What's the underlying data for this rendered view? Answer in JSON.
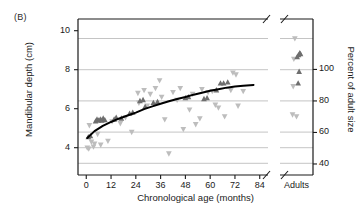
{
  "figure": {
    "panel_label": "(B)",
    "background": "#ffffff",
    "frame_color": "#1a1a1a",
    "gridline_color": "#b5b5b5",
    "curve_color": "#000000",
    "marker_dark_color": "#6e6e6e",
    "marker_light_color": "#bdbdbd"
  },
  "chart_data": {
    "type": "scatter",
    "title": "",
    "subtitle": "",
    "panel": "(B)",
    "xlabel": "Chronological age (months)",
    "ylabel": "Mandibular depth (cm)",
    "y2label": "Percent of adult size",
    "xlim": [
      -4,
      88
    ],
    "ylim": [
      2.6,
      10.6
    ],
    "y2lim": [
      33,
      132
    ],
    "grid": true,
    "grid_axis": "y",
    "legend": "none",
    "axis_break_x": true,
    "axis_break_note": "x-axis broken after 84 months; separate 'Adults' category panel at right",
    "xticks": [
      0,
      12,
      24,
      36,
      48,
      60,
      72,
      84
    ],
    "xticklabels": [
      "0",
      "12",
      "24",
      "36",
      "48",
      "60",
      "72",
      "84"
    ],
    "extra_xtick_label": "Adults",
    "yticks": [
      4,
      6,
      8,
      10
    ],
    "yticklabels": [
      "4",
      "6",
      "8",
      "10"
    ],
    "y2ticks": [
      40,
      60,
      80,
      100
    ],
    "y2ticklabels": [
      "40",
      "60",
      "80",
      "100"
    ],
    "gridline_values": [
      3.2,
      4.0,
      4.8,
      6.4,
      8.0,
      9.6
    ],
    "series": [
      {
        "name": "dark-up-triangles",
        "marker": "triangle-up",
        "color": "#6e6e6e",
        "points": [
          [
            1.0,
            4.55
          ],
          [
            2.0,
            4.6
          ],
          [
            4.5,
            5.35
          ],
          [
            5.2,
            5.45
          ],
          [
            6.0,
            5.4
          ],
          [
            6.8,
            5.45
          ],
          [
            7.5,
            5.4
          ],
          [
            8.2,
            5.5
          ],
          [
            9.0,
            5.42
          ],
          [
            13.5,
            5.45
          ],
          [
            14.5,
            5.55
          ],
          [
            17.0,
            5.5
          ],
          [
            21.0,
            5.75
          ],
          [
            22.5,
            5.8
          ],
          [
            26.0,
            6.4
          ],
          [
            27.5,
            6.45
          ],
          [
            28.5,
            6.1
          ],
          [
            32.5,
            6.3
          ],
          [
            34.5,
            6.35
          ],
          [
            48.0,
            6.55
          ],
          [
            49.5,
            6.6
          ],
          [
            57.0,
            6.5
          ],
          [
            58.5,
            6.55
          ],
          [
            63.0,
            6.95
          ],
          [
            65.0,
            7.3
          ],
          [
            66.5,
            7.3
          ],
          [
            68.5,
            7.35
          ]
        ]
      },
      {
        "name": "light-down-triangles",
        "marker": "triangle-down",
        "color": "#bdbdbd",
        "points": [
          [
            0.5,
            4.0
          ],
          [
            1.2,
            3.95
          ],
          [
            1.5,
            5.15
          ],
          [
            2.5,
            4.3
          ],
          [
            3.5,
            4.05
          ],
          [
            4.0,
            4.2
          ],
          [
            5.5,
            4.7
          ],
          [
            7.0,
            4.15
          ],
          [
            10.5,
            4.35
          ],
          [
            12.5,
            5.35
          ],
          [
            16.5,
            5.25
          ],
          [
            19.0,
            5.55
          ],
          [
            22.0,
            4.8
          ],
          [
            25.0,
            6.8
          ],
          [
            25.5,
            6.3
          ],
          [
            28.0,
            6.95
          ],
          [
            29.5,
            6.15
          ],
          [
            31.0,
            6.75
          ],
          [
            33.5,
            7.05
          ],
          [
            35.5,
            7.45
          ],
          [
            36.5,
            6.6
          ],
          [
            38.0,
            5.45
          ],
          [
            40.0,
            3.7
          ],
          [
            42.0,
            6.85
          ],
          [
            44.0,
            6.45
          ],
          [
            45.5,
            7.05
          ],
          [
            47.0,
            4.95
          ],
          [
            50.0,
            5.95
          ],
          [
            51.5,
            6.75
          ],
          [
            53.0,
            5.2
          ],
          [
            55.0,
            5.5
          ],
          [
            56.0,
            7.0
          ],
          [
            59.0,
            6.85
          ],
          [
            61.0,
            6.9
          ],
          [
            62.5,
            6.2
          ],
          [
            64.0,
            6.05
          ],
          [
            67.0,
            5.6
          ],
          [
            70.0,
            6.95
          ],
          [
            71.0,
            7.85
          ],
          [
            72.5,
            7.75
          ],
          [
            73.5,
            6.15
          ],
          [
            76.0,
            6.9
          ]
        ]
      },
      {
        "name": "adults-dark-up-triangles",
        "marker": "triangle-up",
        "color": "#6e6e6e",
        "category": "Adults",
        "points": [
          [
            0.52,
            8.65
          ],
          [
            0.56,
            8.75
          ],
          [
            0.6,
            8.85
          ],
          [
            0.62,
            8.8
          ],
          [
            0.58,
            7.9
          ],
          [
            0.55,
            7.3
          ]
        ]
      },
      {
        "name": "adults-light-down-triangles",
        "marker": "triangle-down",
        "color": "#bdbdbd",
        "category": "Adults",
        "points": [
          [
            0.45,
            9.6
          ],
          [
            0.42,
            8.55
          ],
          [
            0.4,
            7.15
          ],
          [
            0.38,
            5.7
          ],
          [
            0.5,
            5.6
          ]
        ]
      }
    ],
    "fit_curve": {
      "name": "fitted-growth-curve",
      "color": "#000000",
      "width": 2,
      "description": "logarithmic growth fit",
      "points": [
        [
          0.5,
          4.5
        ],
        [
          4,
          4.85
        ],
        [
          8,
          5.12
        ],
        [
          12,
          5.32
        ],
        [
          16,
          5.5
        ],
        [
          20,
          5.65
        ],
        [
          24,
          5.8
        ],
        [
          28,
          5.98
        ],
        [
          32,
          6.12
        ],
        [
          36,
          6.25
        ],
        [
          40,
          6.38
        ],
        [
          44,
          6.5
        ],
        [
          48,
          6.6
        ],
        [
          52,
          6.72
        ],
        [
          56,
          6.82
        ],
        [
          60,
          6.92
        ],
        [
          64,
          7.0
        ],
        [
          68,
          7.08
        ],
        [
          72,
          7.14
        ],
        [
          76,
          7.18
        ],
        [
          81,
          7.22
        ]
      ]
    }
  }
}
